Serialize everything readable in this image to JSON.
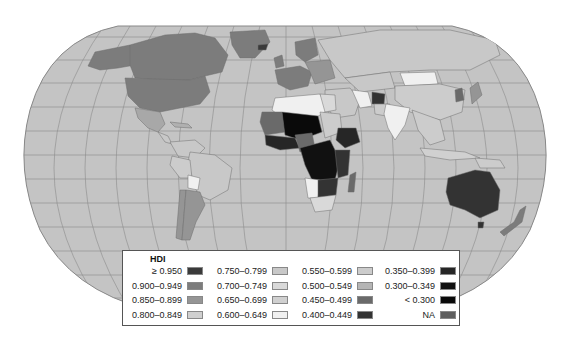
{
  "map": {
    "projection": "Robinson",
    "ocean_color": "#c4c4c4",
    "graticule_color": "#8c8c8c",
    "border_color": "#7a7a7a"
  },
  "legend": {
    "title": "HDI",
    "columns": [
      [
        {
          "label": "≥ 0.950",
          "color": "#3a3a3a"
        },
        {
          "label": "0.900–0.949",
          "color": "#7c7c7c"
        },
        {
          "label": "0.850–0.899",
          "color": "#959595"
        },
        {
          "label": "0.800–0.849",
          "color": "#cfcfcf"
        }
      ],
      [
        {
          "label": "0.750–0.799",
          "color": "#c8c8c8"
        },
        {
          "label": "0.700–0.749",
          "color": "#d9d9d9"
        },
        {
          "label": "0.650–0.699",
          "color": "#d0d0d0"
        },
        {
          "label": "0.600–0.649",
          "color": "#f0f0f0"
        }
      ],
      [
        {
          "label": "0.550–0.599",
          "color": "#cccccc"
        },
        {
          "label": "0.500–0.549",
          "color": "#b5b5b5"
        },
        {
          "label": "0.450–0.499",
          "color": "#6a6a6a"
        },
        {
          "label": "0.400–0.449",
          "color": "#333333"
        }
      ],
      [
        {
          "label": "0.350–0.399",
          "color": "#262626"
        },
        {
          "label": "0.300–0.349",
          "color": "#111111"
        },
        {
          "label": "< 0.300",
          "color": "#0a0a0a"
        },
        {
          "label": "NA",
          "color": "#5e5e5e"
        }
      ]
    ]
  }
}
